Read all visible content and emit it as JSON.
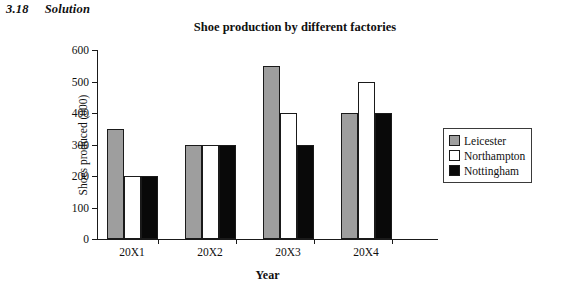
{
  "header": {
    "number": "3.18",
    "label": "Solution"
  },
  "chart_data": {
    "type": "bar",
    "title": "Shoe production by different factories",
    "xlabel": "Year",
    "ylabel": "Shoes produced (000)",
    "categories": [
      "20X1",
      "20X2",
      "20X3",
      "20X4"
    ],
    "series": [
      {
        "name": "Leicester",
        "color": "#9e9e9e",
        "values": [
          350,
          300,
          550,
          400
        ]
      },
      {
        "name": "Northampton",
        "color": "#ffffff",
        "values": [
          200,
          300,
          400,
          500
        ]
      },
      {
        "name": "Nottingham",
        "color": "#090909",
        "values": [
          200,
          300,
          300,
          400
        ]
      }
    ],
    "ylim": [
      0,
      600
    ],
    "yticks": [
      0,
      100,
      200,
      300,
      400,
      500,
      600
    ],
    "ytick_labels": [
      "0",
      "100",
      "200",
      "300",
      "400",
      "500",
      "600"
    ],
    "grid": false,
    "legend_position": "right"
  }
}
